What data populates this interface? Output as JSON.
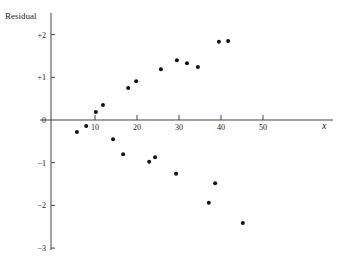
{
  "chart_data": {
    "type": "scatter",
    "title": "",
    "xlabel": "x",
    "ylabel": "Residual",
    "xlim": [
      0,
      58
    ],
    "ylim": [
      -3,
      2.2
    ],
    "grid": false,
    "legend": null,
    "x_ticks": [
      10,
      20,
      30,
      40,
      50
    ],
    "x_tick_labels": [
      "10",
      "20",
      "30",
      "40",
      "50"
    ],
    "y_ticks": [
      2,
      1,
      0,
      -1,
      -2,
      -3
    ],
    "y_tick_labels": [
      "+2",
      "+1",
      "0",
      "−1",
      "−2",
      "−3"
    ],
    "series": [
      {
        "name": "residuals",
        "color": "#111111",
        "points": [
          {
            "x": 5.7,
            "y": -0.28
          },
          {
            "x": 7.9,
            "y": -0.14
          },
          {
            "x": 10.2,
            "y": 0.19
          },
          {
            "x": 11.9,
            "y": 0.35
          },
          {
            "x": 14.3,
            "y": -0.45
          },
          {
            "x": 16.7,
            "y": -0.8
          },
          {
            "x": 17.9,
            "y": 0.75
          },
          {
            "x": 19.8,
            "y": 0.91
          },
          {
            "x": 22.9,
            "y": -0.98
          },
          {
            "x": 24.3,
            "y": -0.87
          },
          {
            "x": 25.7,
            "y": 1.19
          },
          {
            "x": 29.3,
            "y": -1.26
          },
          {
            "x": 29.5,
            "y": 1.4
          },
          {
            "x": 31.9,
            "y": 1.33
          },
          {
            "x": 34.5,
            "y": 1.24
          },
          {
            "x": 37.1,
            "y": -1.94
          },
          {
            "x": 38.6,
            "y": -1.48
          },
          {
            "x": 39.5,
            "y": 1.83
          },
          {
            "x": 41.7,
            "y": 1.85
          },
          {
            "x": 45.2,
            "y": -2.41
          }
        ]
      }
    ]
  },
  "labels": {
    "y_axis_title": "Residual",
    "x_axis_title": "x"
  }
}
